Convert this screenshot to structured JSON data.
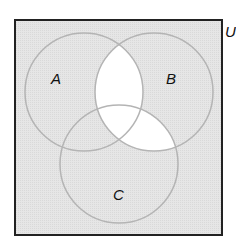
{
  "diagram": {
    "type": "venn",
    "universe_label": "U",
    "sets": [
      {
        "name": "A",
        "label": "A"
      },
      {
        "name": "B",
        "label": "B"
      },
      {
        "name": "C",
        "label": "C"
      }
    ],
    "shaded_regions": [
      "A only",
      "B only",
      "C only",
      "A∩C only",
      "outside all sets"
    ],
    "unshaded_regions": [
      "A∩B (incl. A∩B∩C)",
      "B∩C"
    ],
    "colors": {
      "shading": "#e4e4e4",
      "unshaded": "#ffffff",
      "circle_stroke": "#b4b4b4",
      "border": "#222222"
    }
  }
}
